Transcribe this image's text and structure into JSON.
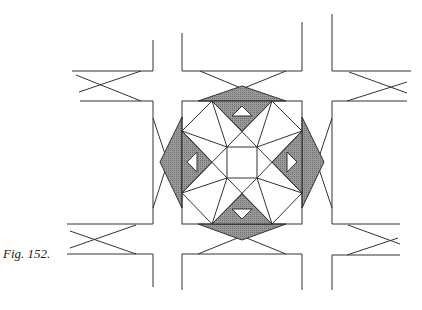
{
  "figure": {
    "caption": "Fig. 152.",
    "colors": {
      "line": "#333333",
      "shade": "#8c8c8c",
      "background": "#ffffff"
    },
    "elements": {
      "central_square": {
        "x": 182,
        "y": 101,
        "w": 120,
        "h": 123
      },
      "inner_square": {
        "x": 227,
        "y": 147,
        "w": 30,
        "h": 31
      },
      "corridor_arms": [
        "top",
        "bottom",
        "left",
        "right"
      ],
      "x_crossings": [
        "top-left",
        "top-right",
        "bottom-left",
        "bottom-right",
        "top",
        "bottom",
        "left",
        "right"
      ]
    }
  }
}
